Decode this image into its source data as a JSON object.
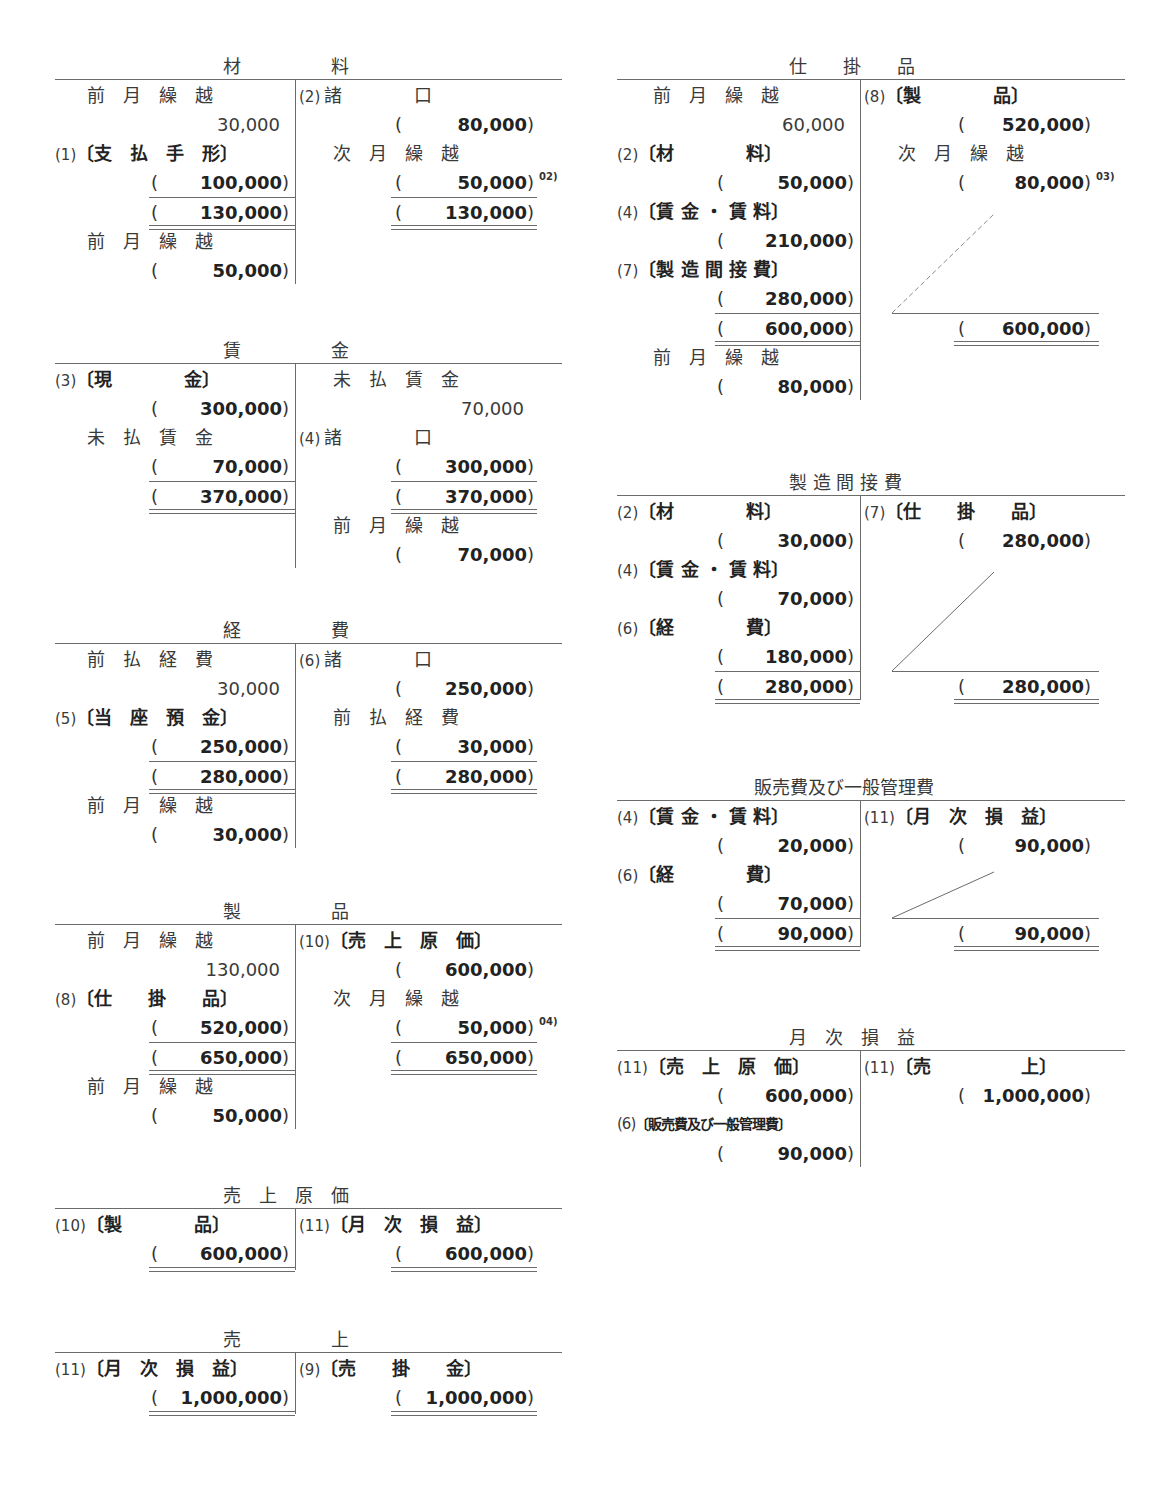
{
  "accounts": {
    "zairyo": {
      "title": "材　　　　　料",
      "debit": [
        {
          "label": "前　月　繰　越",
          "amount": "30,000"
        },
        {
          "num": "(1)",
          "label": "〔支　払　手　形〕",
          "amount": "100,000"
        },
        {
          "total": "130,000"
        },
        {
          "label": "前　月　繰　越",
          "amount": "50,000"
        }
      ],
      "credit": [
        {
          "num": "(2)",
          "label": "諸　　　　口",
          "amount": "80,000"
        },
        {
          "label": "次　月　繰　越",
          "amount": "50,000",
          "note": "02)"
        },
        {
          "total": "130,000"
        }
      ]
    },
    "chingin": {
      "title": "賃　　　　　金",
      "debit": [
        {
          "num": "(3)",
          "label": "〔現　　　　金〕",
          "amount": "300,000"
        },
        {
          "label": "未　払　賃　金",
          "amount": "70,000"
        },
        {
          "total": "370,000"
        }
      ],
      "credit": [
        {
          "label": "未　払　賃　金",
          "amount": "70,000"
        },
        {
          "num": "(4)",
          "label": "諸　　　　口",
          "amount": "300,000"
        },
        {
          "total": "370,000"
        },
        {
          "label": "前　月　繰　越",
          "amount": "70,000"
        }
      ]
    },
    "keihi": {
      "title": "経　　　　　費",
      "debit": [
        {
          "label": "前　払　経　費",
          "amount": "30,000"
        },
        {
          "num": "(5)",
          "label": "〔当　座　預　金〕",
          "amount": "250,000"
        },
        {
          "total": "280,000"
        },
        {
          "label": "前　月　繰　越",
          "amount": "30,000"
        }
      ],
      "credit": [
        {
          "num": "(6)",
          "label": "諸　　　　口",
          "amount": "250,000"
        },
        {
          "label": "前　払　経　費",
          "amount": "30,000"
        },
        {
          "total": "280,000"
        }
      ]
    },
    "seihin": {
      "title": "製　　　　　品",
      "debit": [
        {
          "label": "前　月　繰　越",
          "amount": "130,000"
        },
        {
          "num": "(8)",
          "label": "〔仕　　掛　　品〕",
          "amount": "520,000"
        },
        {
          "total": "650,000"
        },
        {
          "label": "前　月　繰　越",
          "amount": "50,000"
        }
      ],
      "credit": [
        {
          "num": "(10)",
          "label": "〔売　上　原　価〕",
          "amount": "600,000"
        },
        {
          "label": "次　月　繰　越",
          "amount": "50,000",
          "note": "04)"
        },
        {
          "total": "650,000"
        }
      ]
    },
    "uriage_genka": {
      "title": "売　上　原　価",
      "debit": [
        {
          "num": "(10)",
          "label": "〔製　　　　品〕",
          "amount": "600,000"
        }
      ],
      "credit": [
        {
          "num": "(11)",
          "label": "〔月　次　損　益〕",
          "amount": "600,000"
        }
      ]
    },
    "uriage": {
      "title": "売　　　　　上",
      "debit": [
        {
          "num": "(11)",
          "label": "〔月　次　損　益〕",
          "amount": "1,000,000"
        }
      ],
      "credit": [
        {
          "num": "(9)",
          "label": "〔売　　掛　　金〕",
          "amount": "1,000,000"
        }
      ]
    },
    "shikakehin": {
      "title": "仕　　掛　　品",
      "debit": [
        {
          "label": "前　月　繰　越",
          "amount": "60,000"
        },
        {
          "num": "(2)",
          "label": "〔材　　　　料〕",
          "amount": "50,000"
        },
        {
          "num": "(4)",
          "label": "〔賃 金 ・ 賃 料〕",
          "amount": "210,000"
        },
        {
          "num": "(7)",
          "label": "〔製 造 間 接 費〕",
          "amount": "280,000"
        },
        {
          "total": "600,000"
        },
        {
          "label": "前　月　繰　越",
          "amount": "80,000"
        }
      ],
      "credit": [
        {
          "num": "(8)",
          "label": "〔製　　　　品〕",
          "amount": "520,000"
        },
        {
          "label": "次　月　繰　越",
          "amount": "80,000",
          "note": "03)"
        },
        {
          "total": "600,000"
        }
      ]
    },
    "seizo_kansetsuhi": {
      "title": "製 造 間 接 費",
      "debit": [
        {
          "num": "(2)",
          "label": "〔材　　　　料〕",
          "amount": "30,000"
        },
        {
          "num": "(4)",
          "label": "〔賃 金 ・ 賃 料〕",
          "amount": "70,000"
        },
        {
          "num": "(6)",
          "label": "〔経　　　　費〕",
          "amount": "180,000"
        },
        {
          "total": "280,000"
        }
      ],
      "credit": [
        {
          "num": "(7)",
          "label": "〔仕　　掛　　品〕",
          "amount": "280,000"
        },
        {
          "total": "280,000"
        }
      ]
    },
    "hanbaihi": {
      "title": "販売費及び一般管理費",
      "debit": [
        {
          "num": "(4)",
          "label": "〔賃 金 ・ 賃 料〕",
          "amount": "20,000"
        },
        {
          "num": "(6)",
          "label": "〔経　　　　費〕",
          "amount": "70,000"
        },
        {
          "total": "90,000"
        }
      ],
      "credit": [
        {
          "num": "(11)",
          "label": "〔月　次　損　益〕",
          "amount": "90,000"
        },
        {
          "total": "90,000"
        }
      ]
    },
    "getsuji_soneki": {
      "title": "月　次　損　益",
      "debit": [
        {
          "num": "(11)",
          "label": "〔売　上　原　価〕",
          "amount": "600,000"
        },
        {
          "num": "(6)",
          "label": "〔販売費及び一般管理費〕",
          "amount": "90,000"
        }
      ],
      "credit": [
        {
          "num": "(11)",
          "label": "〔売　　　　　上〕",
          "amount": "1,000,000"
        }
      ]
    }
  }
}
